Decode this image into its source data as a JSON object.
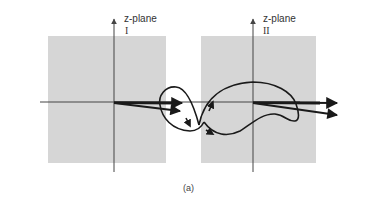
{
  "figure": {
    "caption": "(a)",
    "colors": {
      "panel_fill": "#d6d6d6",
      "axis": "#444444",
      "curve": "#1a1a1a",
      "background": "#ffffff"
    },
    "panels": [
      {
        "id": "I",
        "plane_label": "z-plane",
        "numeral": "I"
      },
      {
        "id": "II",
        "plane_label": "z-plane",
        "numeral": "II"
      }
    ]
  }
}
